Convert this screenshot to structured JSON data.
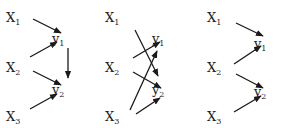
{
  "diagrams": [
    {
      "id": "left",
      "nodes": [
        {
          "id": "x1",
          "base": "X",
          "sub": "1",
          "x": 18,
          "y": 18
        },
        {
          "id": "x2",
          "base": "X",
          "sub": "2",
          "x": 18,
          "y": 68
        },
        {
          "id": "x3",
          "base": "X",
          "sub": "3",
          "x": 18,
          "y": 117
        },
        {
          "id": "y1",
          "base": "y",
          "sub": "1",
          "x": 64,
          "y": 39
        },
        {
          "id": "y2",
          "base": "y",
          "sub": "2",
          "x": 64,
          "y": 90
        }
      ],
      "edges": [
        {
          "from": "x1",
          "to": "y1",
          "x1": 33,
          "y1": 19,
          "x2": 61,
          "y2": 33
        },
        {
          "from": "x2",
          "to": "y1",
          "x1": 30,
          "y1": 57,
          "x2": 57,
          "y2": 42
        },
        {
          "from": "x2",
          "to": "y2",
          "x1": 33,
          "y1": 71,
          "x2": 61,
          "y2": 85
        },
        {
          "from": "x3",
          "to": "y2",
          "x1": 30,
          "y1": 109,
          "x2": 57,
          "y2": 94
        },
        {
          "from": "y1",
          "to": "y2",
          "x1": 68,
          "y1": 48,
          "x2": 68,
          "y2": 78
        }
      ]
    },
    {
      "id": "middle",
      "nodes": [
        {
          "id": "x1",
          "base": "X",
          "sub": "1",
          "x": 117,
          "y": 18
        },
        {
          "id": "x2",
          "base": "X",
          "sub": "2",
          "x": 117,
          "y": 68
        },
        {
          "id": "x3",
          "base": "X",
          "sub": "3",
          "x": 117,
          "y": 117
        },
        {
          "id": "y1",
          "base": "y",
          "sub": "1",
          "x": 164,
          "y": 39
        },
        {
          "id": "y2",
          "base": "y",
          "sub": "2",
          "x": 164,
          "y": 90
        }
      ],
      "edges": [
        {
          "from": "x1",
          "to": "y2",
          "x1": 135,
          "y1": 30,
          "x2": 158,
          "y2": 76
        },
        {
          "from": "x2",
          "to": "y1",
          "x1": 133,
          "y1": 58,
          "x2": 160,
          "y2": 42
        },
        {
          "from": "x2",
          "to": "y2",
          "x1": 133,
          "y1": 72,
          "x2": 161,
          "y2": 88
        },
        {
          "from": "x3",
          "to": "y1",
          "x1": 130,
          "y1": 110,
          "x2": 157,
          "y2": 51
        },
        {
          "from": "x3",
          "to": "y2",
          "x1": 136,
          "y1": 114,
          "x2": 160,
          "y2": 98
        }
      ]
    },
    {
      "id": "right",
      "nodes": [
        {
          "id": "x1",
          "base": "X",
          "sub": "1",
          "x": 219,
          "y": 18
        },
        {
          "id": "x2",
          "base": "X",
          "sub": "2",
          "x": 219,
          "y": 68
        },
        {
          "id": "x3",
          "base": "X",
          "sub": "3",
          "x": 219,
          "y": 117
        },
        {
          "id": "y1",
          "base": "y",
          "sub": "1",
          "x": 266,
          "y": 44
        },
        {
          "id": "y2",
          "base": "y",
          "sub": "2",
          "x": 266,
          "y": 92
        }
      ],
      "edges": [
        {
          "from": "x1",
          "to": "y1",
          "x1": 236,
          "y1": 23,
          "x2": 263,
          "y2": 36
        },
        {
          "from": "x2",
          "to": "y1",
          "x1": 234,
          "y1": 64,
          "x2": 261,
          "y2": 46
        },
        {
          "from": "x2",
          "to": "y2",
          "x1": 236,
          "y1": 74,
          "x2": 263,
          "y2": 88
        },
        {
          "from": "x3",
          "to": "y2",
          "x1": 234,
          "y1": 112,
          "x2": 261,
          "y2": 96
        }
      ]
    }
  ]
}
